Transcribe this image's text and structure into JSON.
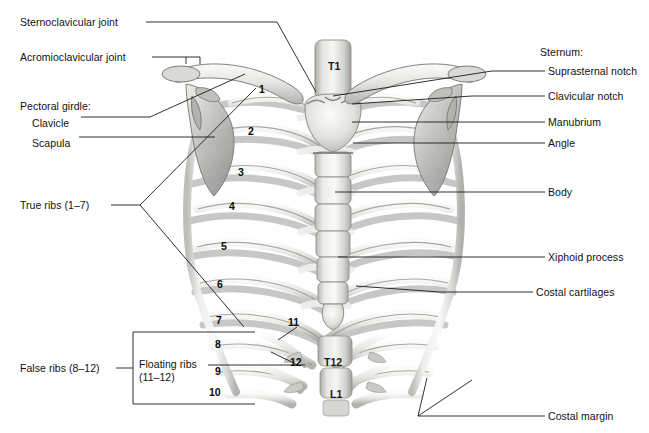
{
  "figure": {
    "background_color": "#ffffff",
    "text_color": "#111111",
    "leader_line_color": "#1a1a1a",
    "bone_light": "#f4f4f2",
    "bone_mid": "#d8d8d5",
    "bone_shadow": "#a8a8a6",
    "width": 649,
    "height": 433
  },
  "labels_left": [
    {
      "id": "sternoclavicular-joint",
      "text": "Sternoclavicular joint",
      "x": 20,
      "y": 22
    },
    {
      "id": "acromioclavicular-joint",
      "text": "Acromioclavicular joint",
      "x": 20,
      "y": 57
    },
    {
      "id": "pectoral-girdle",
      "text": "Pectoral girdle:",
      "x": 20,
      "y": 100
    },
    {
      "id": "clavicle",
      "text": "Clavicle",
      "x": 32,
      "y": 117
    },
    {
      "id": "scapula",
      "text": "Scapula",
      "x": 32,
      "y": 137
    },
    {
      "id": "true-ribs",
      "text": "True ribs (1–7)",
      "x": 20,
      "y": 205
    },
    {
      "id": "false-ribs",
      "text": "False ribs (8–12)",
      "x": 20,
      "y": 368
    },
    {
      "id": "floating-ribs",
      "text": "Floating ribs\n(11–12)",
      "x": 139,
      "y": 362
    }
  ],
  "labels_right": [
    {
      "id": "sternum-group",
      "text": "Sternum:",
      "x": 540,
      "y": 52
    },
    {
      "id": "suprasternal-notch",
      "text": "Suprasternal notch",
      "x": 548,
      "y": 71
    },
    {
      "id": "clavicular-notch",
      "text": "Clavicular notch",
      "x": 548,
      "y": 96
    },
    {
      "id": "manubrium",
      "text": "Manubrium",
      "x": 548,
      "y": 118
    },
    {
      "id": "angle",
      "text": "Angle",
      "x": 548,
      "y": 140
    },
    {
      "id": "body",
      "text": "Body",
      "x": 548,
      "y": 188
    },
    {
      "id": "xiphoid-process",
      "text": "Xiphoid process",
      "x": 548,
      "y": 253
    },
    {
      "id": "costal-cartilages",
      "text": "Costal cartilages",
      "x": 536,
      "y": 288
    },
    {
      "id": "costal-margin",
      "text": "Costal margin",
      "x": 548,
      "y": 412
    }
  ],
  "rib_numbers": [
    {
      "label": "1",
      "x": 259,
      "y": 89
    },
    {
      "label": "2",
      "x": 248,
      "y": 131
    },
    {
      "label": "3",
      "x": 238,
      "y": 172
    },
    {
      "label": "4",
      "x": 229,
      "y": 206
    },
    {
      "label": "5",
      "x": 221,
      "y": 246
    },
    {
      "label": "6",
      "x": 217,
      "y": 284
    },
    {
      "label": "7",
      "x": 216,
      "y": 320
    },
    {
      "label": "8",
      "x": 215,
      "y": 344
    },
    {
      "label": "9",
      "x": 215,
      "y": 371
    },
    {
      "label": "10",
      "x": 212,
      "y": 392
    },
    {
      "label": "11",
      "x": 290,
      "y": 322
    },
    {
      "label": "12",
      "x": 292,
      "y": 362
    }
  ],
  "vertebra_labels": [
    {
      "label": "T1",
      "x": 336,
      "y": 66
    },
    {
      "label": "T12",
      "x": 330,
      "y": 362
    },
    {
      "label": "L1",
      "x": 337,
      "y": 394
    }
  ]
}
